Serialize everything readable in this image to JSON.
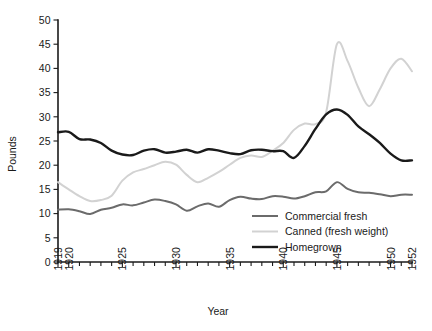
{
  "chart_data": {
    "type": "line",
    "title": "",
    "xlabel": "Year",
    "ylabel": "Pounds",
    "xlim": [
      1919,
      1952
    ],
    "ylim": [
      0,
      50
    ],
    "grid": false,
    "legend_position": "inside-lower-right",
    "y_ticks": [
      0,
      5,
      10,
      15,
      20,
      25,
      30,
      35,
      40,
      45,
      50
    ],
    "y_tick_labels": [
      "0",
      "5",
      "10",
      "15",
      "20",
      "25",
      "30",
      "35",
      "40",
      "45",
      "50"
    ],
    "x_tick_labels": [
      "1919",
      "1920",
      "1925",
      "1930",
      "1935",
      "1940",
      "1945",
      "1950",
      "1952"
    ],
    "x_minor_ticks_every": 1,
    "x": [
      1919,
      1920,
      1921,
      1922,
      1923,
      1924,
      1925,
      1926,
      1927,
      1928,
      1929,
      1930,
      1931,
      1932,
      1933,
      1934,
      1935,
      1936,
      1937,
      1938,
      1939,
      1940,
      1941,
      1942,
      1943,
      1944,
      1945,
      1946,
      1947,
      1948,
      1949,
      1950,
      1951,
      1952
    ],
    "series": [
      {
        "name": "Commercial fresh",
        "color": "#6b6b6b",
        "width": 2.0,
        "values": [
          10.8,
          10.9,
          10.5,
          9.9,
          10.8,
          11.2,
          11.9,
          11.7,
          12.3,
          12.9,
          12.6,
          11.9,
          10.6,
          11.5,
          12.1,
          11.4,
          12.8,
          13.5,
          13.1,
          13.0,
          13.6,
          13.5,
          13.1,
          13.6,
          14.4,
          14.6,
          16.5,
          15.1,
          14.4,
          14.3,
          14.0,
          13.6,
          13.9,
          13.9
        ]
      },
      {
        "name": "Canned (fresh weight)",
        "color": "#d2d2d2",
        "width": 2.0,
        "values": [
          16.5,
          15.0,
          13.6,
          12.6,
          12.8,
          13.7,
          16.8,
          18.5,
          19.2,
          20.0,
          20.7,
          20.1,
          18.0,
          16.5,
          17.4,
          18.6,
          20.1,
          21.5,
          22.0,
          21.7,
          23.0,
          24.6,
          27.3,
          28.6,
          28.5,
          31.0,
          45.0,
          41.5,
          36.0,
          32.2,
          35.7,
          40.0,
          42.0,
          39.4
        ]
      },
      {
        "name": "Homegrown",
        "color": "#1a1a1a",
        "width": 2.4,
        "values": [
          26.8,
          26.9,
          25.4,
          25.3,
          24.6,
          23.0,
          22.2,
          22.1,
          23.0,
          23.3,
          22.6,
          22.8,
          23.2,
          22.6,
          23.3,
          23.0,
          22.5,
          22.3,
          23.1,
          23.2,
          22.9,
          22.9,
          21.5,
          24.0,
          27.5,
          30.5,
          31.5,
          30.4,
          28.0,
          26.4,
          24.6,
          22.4,
          21.0,
          21.0
        ]
      }
    ],
    "legend": [
      {
        "label": "Commercial fresh",
        "color": "#6b6b6b",
        "width": 2.0
      },
      {
        "label": "Canned (fresh weight)",
        "color": "#d2d2d2",
        "width": 2.0
      },
      {
        "label": "Homegrown",
        "color": "#1a1a1a",
        "width": 2.4
      }
    ]
  }
}
